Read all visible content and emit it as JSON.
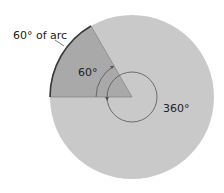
{
  "diagram": {
    "labels": {
      "arc_label": "60° of arc",
      "sector_angle": "60°",
      "full_angle": "360°"
    },
    "colors": {
      "circle_fill": "#c9c9c9",
      "sector_fill": "#a9a9a9",
      "arc_stroke": "#3a3a3a",
      "line_stroke": "#555555"
    },
    "geometry": {
      "center": [
        132,
        97
      ],
      "radius": 82,
      "sector_degrees": 60
    }
  }
}
